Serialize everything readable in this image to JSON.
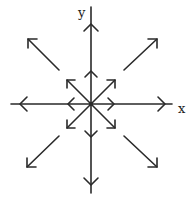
{
  "diagram": {
    "type": "vector-field",
    "axes": {
      "x_label": "x",
      "y_label": "y"
    },
    "colors": {
      "stroke": "#2a2a2a",
      "background": "#ffffff"
    },
    "origin": [
      91,
      104
    ],
    "inner_vectors": [
      {
        "dir": "up"
      },
      {
        "dir": "down"
      },
      {
        "dir": "left"
      },
      {
        "dir": "right"
      },
      {
        "dir": "up-left"
      },
      {
        "dir": "up-right"
      },
      {
        "dir": "down-left"
      },
      {
        "dir": "down-right"
      }
    ],
    "outer_vectors": [
      {
        "dir": "up"
      },
      {
        "dir": "down"
      },
      {
        "dir": "left"
      },
      {
        "dir": "right"
      },
      {
        "dir": "up-left"
      },
      {
        "dir": "up-right"
      },
      {
        "dir": "down-left"
      },
      {
        "dir": "down-right"
      }
    ]
  }
}
